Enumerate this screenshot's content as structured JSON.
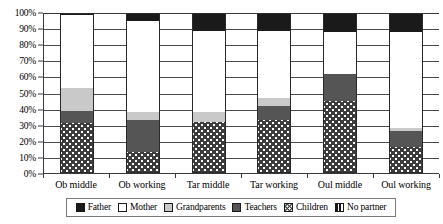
{
  "chart_data": {
    "type": "bar",
    "subtype": "stacked-100-percent",
    "title": "",
    "xlabel": "",
    "ylabel": "",
    "ylim": [
      0,
      100
    ],
    "ytick_labels": [
      "0%",
      "10%",
      "20%",
      "30%",
      "40%",
      "50%",
      "60%",
      "70%",
      "80%",
      "90%",
      "100%"
    ],
    "ytick_values": [
      0,
      10,
      20,
      30,
      40,
      50,
      60,
      70,
      80,
      90,
      100
    ],
    "grid": true,
    "grid_axis": "y",
    "legend_position": "bottom",
    "categories": [
      "Ob middle",
      "Ob working",
      "Tar middle",
      "Tar working",
      "Oul middle",
      "Oul working"
    ],
    "series": [
      {
        "name": "Father",
        "color": "#1a1a1a",
        "pattern": "solid-black",
        "values": [
          1,
          5,
          11,
          11,
          12,
          12
        ]
      },
      {
        "name": "Mother",
        "color": "#ffffff",
        "pattern": "solid-white",
        "values": [
          46,
          57,
          51,
          42,
          26,
          60
        ]
      },
      {
        "name": "Grandparents",
        "color": "#c9c9c9",
        "pattern": "solid-light-gray",
        "values": [
          14,
          5,
          6,
          5,
          0,
          2
        ]
      },
      {
        "name": "Teachers",
        "color": "#555555",
        "pattern": "solid-dark-gray",
        "values": [
          8,
          20,
          0,
          9,
          17,
          10
        ]
      },
      {
        "name": "Children",
        "color": "#3c3c3c",
        "pattern": "checkered-diamond",
        "values": [
          31,
          13,
          32,
          33,
          45,
          16
        ]
      },
      {
        "name": "No partner",
        "color": "#ffffff",
        "pattern": "vertical-stripes",
        "values": [
          0,
          0,
          0,
          0,
          0,
          0
        ]
      }
    ]
  },
  "legend": {
    "items": [
      {
        "label": "Father",
        "swatch": "fill-father"
      },
      {
        "label": "Mother",
        "swatch": "fill-mother"
      },
      {
        "label": "Grandparents",
        "swatch": "fill-grandparents"
      },
      {
        "label": "Teachers",
        "swatch": "fill-teachers"
      },
      {
        "label": "Children",
        "swatch": "fill-children"
      },
      {
        "label": "No partner",
        "swatch": "fill-nopartner"
      }
    ]
  }
}
